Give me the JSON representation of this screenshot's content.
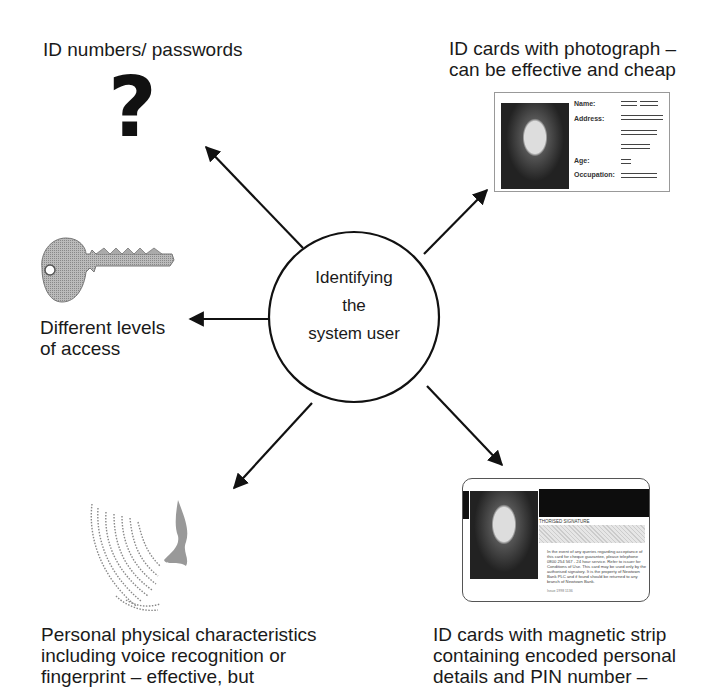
{
  "center": {
    "lines": [
      "Identifying",
      "the",
      "system user"
    ]
  },
  "nodes": {
    "top_left": {
      "label": "ID numbers/ passwords",
      "icon": "question-mark-icon",
      "glyph": "?"
    },
    "top_right": {
      "lines": [
        "ID cards with photograph –",
        "can be effective and cheap"
      ],
      "card": {
        "fields": [
          "Name:",
          "Address:",
          "Age:",
          "Occupation:"
        ]
      }
    },
    "left": {
      "lines": [
        "Different levels",
        "of access"
      ],
      "icon": "key-icon"
    },
    "bottom_left": {
      "lines": [
        "Personal physical characteristics",
        "including voice recognition or",
        "fingerprint – effective, but"
      ],
      "icon": "fingerprint-icon"
    },
    "bottom_right": {
      "lines": [
        "ID cards with magnetic strip",
        "containing encoded personal",
        "details and PIN number –"
      ],
      "card": {
        "signature_label": "THORISED SIGNATURE",
        "small_print": "In the event of any queries regarding acceptance of this card for cheque guarantee, please telephone 0800 254 567 - 24 hour service. Refer to issuer for Conditions of Use. This card may be used only by the authorised signatory. It is the property of Newtown Bank PLC and if found should be returned to any branch of Newtown Bank.",
        "footer": "Issue 1998 1136"
      }
    }
  },
  "colors": {
    "ink": "#1a1a1a",
    "background": "#ffffff"
  }
}
